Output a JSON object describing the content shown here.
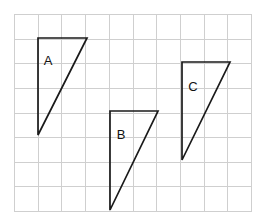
{
  "figure": {
    "title": "",
    "background_color": "#ffffff",
    "grid": {
      "name": "square-grid",
      "x0": 14,
      "y0": 14,
      "x1": 251,
      "y1": 211,
      "columns": 10,
      "rows": 8,
      "cell_width": 23.7,
      "cell_height": 24.625,
      "line_color": "#cfcfcf",
      "border_color": "#cfcfcf",
      "visible": true
    },
    "shapes": [
      {
        "id": "A",
        "label": "A",
        "type": "right-triangle",
        "stroke_color": "#1a1a1a",
        "fill": "none",
        "points": "38,38 87,38 38,135",
        "vertices": [
          {
            "x": 38,
            "y": 38
          },
          {
            "x": 87,
            "y": 38
          },
          {
            "x": 38,
            "y": 135
          }
        ],
        "grid_units": {
          "base": 2,
          "height": 4
        },
        "label_x": 48,
        "label_y": 62
      },
      {
        "id": "B",
        "label": "B",
        "type": "right-triangle",
        "stroke_color": "#1a1a1a",
        "fill": "none",
        "points": "110,111 158,111 110,210",
        "vertices": [
          {
            "x": 110,
            "y": 111
          },
          {
            "x": 158,
            "y": 111
          },
          {
            "x": 110,
            "y": 210
          }
        ],
        "grid_units": {
          "base": 2,
          "height": 4
        },
        "label_x": 121,
        "label_y": 136
      },
      {
        "id": "C",
        "label": "C",
        "type": "right-triangle",
        "stroke_color": "#1a1a1a",
        "fill": "none",
        "points": "182,62 230,62 182,160",
        "vertices": [
          {
            "x": 182,
            "y": 62
          },
          {
            "x": 230,
            "y": 62
          },
          {
            "x": 182,
            "y": 160
          }
        ],
        "grid_units": {
          "base": 2,
          "height": 4
        },
        "label_x": 193,
        "label_y": 88
      }
    ]
  }
}
